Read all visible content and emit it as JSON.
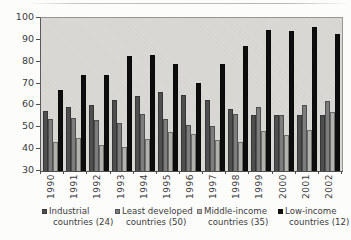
{
  "chart_data": {
    "type": "bar",
    "title": "",
    "xlabel": "",
    "ylabel": "",
    "categories": [
      "1990",
      "1991",
      "1992",
      "1993",
      "1994",
      "1995",
      "1996",
      "1997",
      "1998",
      "1999",
      "2000",
      "2001",
      "2002"
    ],
    "series": [
      {
        "name": "Industrial countries (24)",
        "legend_lines": [
          "Industrial",
          "countries (24)"
        ],
        "color": "#4f4f4f",
        "values": [
          57.5,
          59.5,
          60,
          62.5,
          64.5,
          66,
          65,
          62.5,
          58.5,
          55.5,
          55.5,
          55.5,
          55.5
        ]
      },
      {
        "name": "Least developed countries (50)",
        "legend_lines": [
          "Least developed",
          "countries (50)"
        ],
        "color": "#7d7d7d",
        "values": [
          54,
          54.5,
          53.5,
          52,
          56,
          54,
          51,
          50.5,
          56,
          59.5,
          55.5,
          60,
          62
        ]
      },
      {
        "name": "Middle-income countries (35)",
        "legend_lines": [
          "Middle-income",
          "countries (35)"
        ],
        "color": "#b4b2ae",
        "values": [
          43.5,
          45,
          42,
          41,
          44.5,
          48,
          47,
          44,
          43.5,
          48.5,
          46.5,
          49,
          57
        ]
      },
      {
        "name": "Low-income countries (12)",
        "legend_lines": [
          "Low-income",
          "countries (12)"
        ],
        "color": "#0d0d0d",
        "values": [
          67,
          74,
          74,
          82.5,
          83,
          79,
          70.5,
          79,
          87,
          94.5,
          94,
          96,
          92.5
        ]
      }
    ],
    "ylim": [
      30,
      100
    ],
    "yticks": [
      30,
      40,
      50,
      60,
      70,
      80,
      90,
      100
    ],
    "grid": false,
    "legend_position": "bottom",
    "plot_bg": "#d8d6d2",
    "text_color": "#3b3b3b"
  }
}
